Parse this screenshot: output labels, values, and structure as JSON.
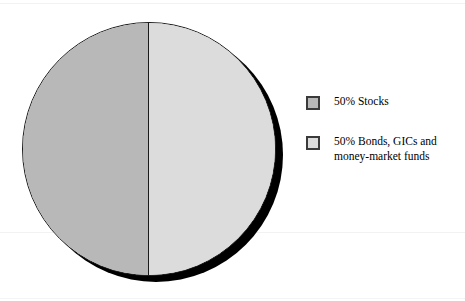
{
  "figure": {
    "background_color": "#ffffff",
    "width": 465,
    "height": 301
  },
  "chart_data": {
    "type": "pie",
    "title": "",
    "subtitle": "",
    "xlabel": "",
    "ylabel": "",
    "grid": false,
    "legend_position": "right",
    "categories": [
      "Stocks",
      "Bonds, GICs and money-market funds"
    ],
    "values": [
      50,
      50
    ],
    "units": "percent",
    "labels": [
      "50% Stocks",
      "50% Bonds, GICs and money-market funds"
    ],
    "colors": [
      "#b8b8b8",
      "#dcdcdc"
    ],
    "slices": [
      {
        "label": "50% Stocks",
        "category": "Stocks",
        "value": 50,
        "color": "#b8b8b8",
        "start_angle": 180,
        "end_angle": 360,
        "position": "left-half"
      },
      {
        "label": "50% Bonds, GICs and money-market funds",
        "category": "Bonds, GICs and money-market funds",
        "value": 50,
        "color": "#dcdcdc",
        "start_angle": 0,
        "end_angle": 180,
        "position": "right-half"
      }
    ],
    "style": {
      "outline_color": "#1a1a1a",
      "divider_color": "#1a1a1a",
      "shadow_color": "#000000",
      "shadow_offset_x": 7,
      "shadow_offset_y": 6
    }
  },
  "legend": {
    "items": [
      {
        "label": "50% Stocks",
        "swatch_color": "#b8b8b8",
        "swatch_border_color": "#3a3a3a"
      },
      {
        "label": "50% Bonds, GICs and\nmoney-market funds",
        "swatch_color": "#dcdcdc",
        "swatch_border_color": "#3a3a3a"
      }
    ]
  }
}
